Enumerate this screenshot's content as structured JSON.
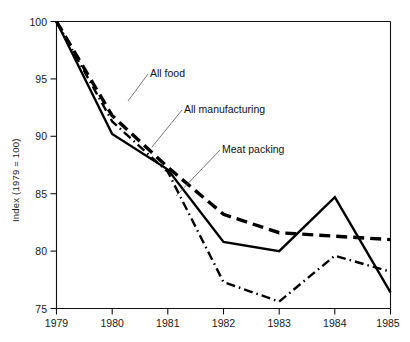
{
  "chart_data": {
    "type": "line",
    "title": "",
    "subtitle": "",
    "xlabel": "",
    "ylabel": "Index (1979 = 100)",
    "x": [
      1979,
      1980,
      1981,
      1982,
      1983,
      1984,
      1985
    ],
    "xtick_labels": [
      "1979",
      "1980",
      "1981",
      "1982",
      "1983",
      "1984",
      "1985"
    ],
    "ytick_labels": [
      "75",
      "80",
      "85",
      "90",
      "95",
      "100"
    ],
    "yticks": [
      75,
      80,
      85,
      90,
      95,
      100
    ],
    "xlim": [
      1979,
      1985
    ],
    "ylim": [
      75,
      100
    ],
    "grid": false,
    "legend_position": "inline-annotations",
    "series": [
      {
        "name": "All food",
        "style": "dashed",
        "values": [
          100,
          91.8,
          87.3,
          83.2,
          81.6,
          81.3,
          81.0
        ]
      },
      {
        "name": "All manufacturing",
        "style": "solid",
        "values": [
          100,
          90.2,
          87.1,
          80.8,
          80.0,
          84.7,
          76.4
        ]
      },
      {
        "name": "Meat packing",
        "style": "dash-dot",
        "values": [
          100,
          91.3,
          86.9,
          77.3,
          75.6,
          79.6,
          78.2
        ]
      }
    ],
    "annotations": [
      {
        "label": "All food",
        "text_x": 150,
        "text_y": 77,
        "leader_from_x": 148,
        "leader_from_y": 74,
        "leader_to_x": 128,
        "leader_to_y": 101
      },
      {
        "label": "All manufacturing",
        "text_x": 184,
        "text_y": 113,
        "leader_from_x": 182,
        "leader_from_y": 110,
        "leader_to_x": 152,
        "leader_to_y": 147
      },
      {
        "label": "Meat packing",
        "text_x": 222,
        "text_y": 153,
        "leader_from_x": 220,
        "leader_from_y": 150,
        "leader_to_x": 176,
        "leader_to_y": 196
      }
    ]
  }
}
